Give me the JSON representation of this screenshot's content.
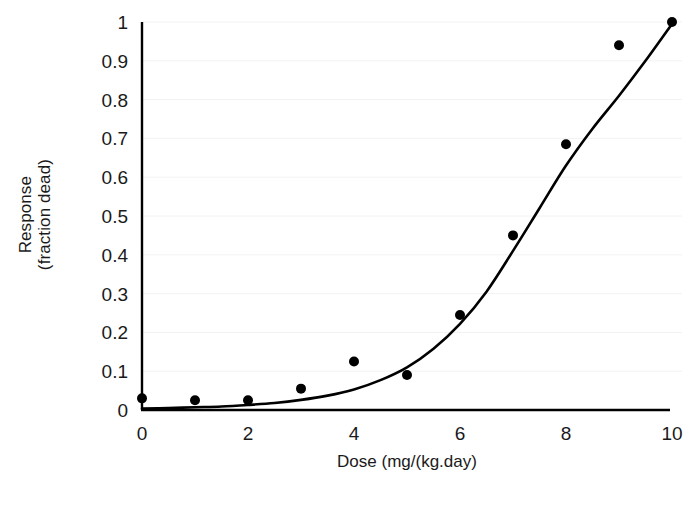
{
  "chart_data": {
    "type": "scatter",
    "title": "",
    "xlabel": "Dose (mg/(kg.day)",
    "ylabel_line1": "Response",
    "ylabel_line2": "(fraction dead)",
    "xlim": [
      0,
      10
    ],
    "ylim": [
      0,
      1
    ],
    "grid": true,
    "grid_color": "#f2f2f2",
    "legend": "none",
    "marker_color": "#000000",
    "curve_color": "#000000",
    "axis_color": "#000000",
    "x_tick_labels": [
      "0",
      "2",
      "4",
      "6",
      "8",
      "10"
    ],
    "x_tick_values": [
      0,
      2,
      4,
      6,
      8,
      10
    ],
    "y_tick_labels": [
      "0",
      "0.1",
      "0.2",
      "0.3",
      "0.4",
      "0.5",
      "0.6",
      "0.7",
      "0.8",
      "0.9",
      "1"
    ],
    "y_tick_values": [
      0,
      0.1,
      0.2,
      0.3,
      0.4,
      0.5,
      0.6,
      0.7,
      0.8,
      0.9,
      1
    ],
    "x": [
      0,
      1,
      2,
      3,
      4,
      5,
      6,
      7,
      8,
      9,
      10
    ],
    "values": [
      0.03,
      0.025,
      0.025,
      0.055,
      0.125,
      0.09,
      0.245,
      0.45,
      0.685,
      0.94,
      1.0
    ],
    "series": [
      {
        "name": "observed response",
        "type": "scatter",
        "x": [
          0,
          1,
          2,
          3,
          4,
          5,
          6,
          7,
          8,
          9,
          10
        ],
        "values": [
          0.03,
          0.025,
          0.025,
          0.055,
          0.125,
          0.09,
          0.245,
          0.45,
          0.685,
          0.94,
          1.0
        ]
      },
      {
        "name": "fitted dose-response curve",
        "type": "line",
        "x": [
          0.0,
          0.5,
          1.0,
          1.5,
          2.0,
          2.5,
          3.0,
          3.5,
          4.0,
          4.5,
          5.0,
          5.5,
          6.0,
          6.5,
          7.0,
          7.5,
          8.0,
          8.5,
          9.0,
          9.5,
          10.0
        ],
        "values": [
          0.004,
          0.005,
          0.007,
          0.009,
          0.013,
          0.018,
          0.026,
          0.037,
          0.053,
          0.077,
          0.11,
          0.158,
          0.222,
          0.305,
          0.41,
          0.52,
          0.63,
          0.725,
          0.81,
          0.9,
          0.995
        ]
      }
    ]
  }
}
